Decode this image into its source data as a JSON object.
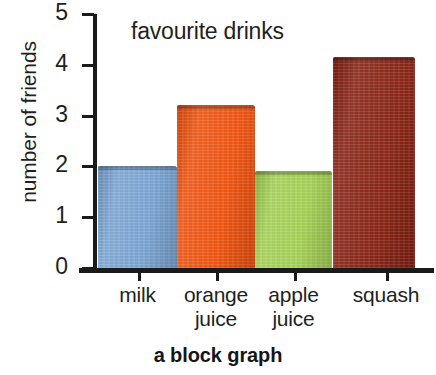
{
  "caption": "a block graph",
  "chart_data": {
    "type": "bar",
    "title": "favourite drinks",
    "xlabel": "",
    "ylabel": "number of friends",
    "categories": [
      "milk",
      "orange juice",
      "apple juice",
      "squash"
    ],
    "category_lines": [
      {
        "line1": "milk",
        "line2": ""
      },
      {
        "line1": "orange",
        "line2": "juice"
      },
      {
        "line1": "apple",
        "line2": "juice"
      },
      {
        "line1": "squash",
        "line2": ""
      }
    ],
    "values": [
      2,
      3.2,
      1.9,
      4.15
    ],
    "ylim": [
      0,
      5
    ],
    "ytick_labels": [
      "0",
      "1",
      "2",
      "3",
      "4",
      "5"
    ],
    "ytick_values": [
      0,
      1,
      2,
      3,
      4,
      5
    ],
    "grid": false,
    "legend": "none",
    "colors": [
      "#7ba7d7",
      "#f4530d",
      "#a7d455",
      "#8a2212"
    ],
    "axis_color": "#1a1a1a",
    "background": "#ffffff"
  }
}
